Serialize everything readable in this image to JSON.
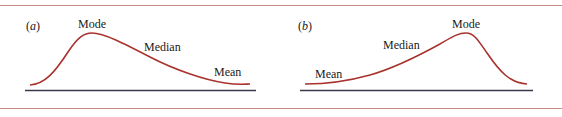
{
  "colors": {
    "rule": "#c98a86",
    "curve": "#a8322c",
    "axis": "#3a3a48",
    "text": "#1a1a1a"
  },
  "panels": [
    {
      "id": "a",
      "label_open": "(",
      "label_letter": "a",
      "label_close": ")",
      "skew": "right-skewed (positive)",
      "labels": {
        "mode": "Mode",
        "median": "Median",
        "mean": "Mean"
      }
    },
    {
      "id": "b",
      "label_open": "(",
      "label_letter": "b",
      "label_close": ")",
      "skew": "left-skewed (negative)",
      "labels": {
        "mode": "Mode",
        "median": "Median",
        "mean": "Mean"
      }
    }
  ]
}
